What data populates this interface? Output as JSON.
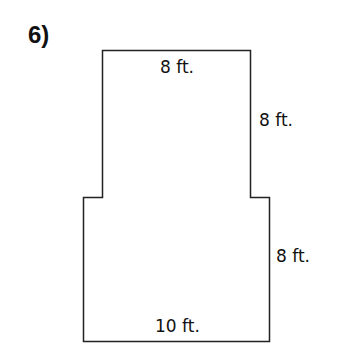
{
  "problem": {
    "number_label": "6)"
  },
  "figure": {
    "type": "composite-rectangle",
    "stroke_color": "#222222",
    "fill_color": "#ffffff",
    "upper_rectangle": {
      "width_label": "8 ft.",
      "height_label": "8 ft."
    },
    "lower_rectangle": {
      "width_label": "10 ft.",
      "height_label": "8 ft."
    }
  },
  "labels": {
    "top": "8 ft.",
    "right_upper": "8 ft.",
    "right_lower": "8 ft.",
    "bottom": "10 ft."
  }
}
